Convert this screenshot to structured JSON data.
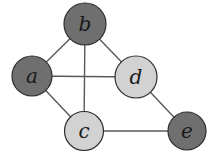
{
  "diagram": {
    "type": "graph",
    "colors": {
      "dark": "#6f6f6f",
      "light": "#d2d2d2",
      "edge": "#5a5a5a"
    },
    "nodes": [
      {
        "id": "a",
        "label": "a",
        "x": 32,
        "y": 76,
        "r": 20,
        "shade": "dark"
      },
      {
        "id": "b",
        "label": "b",
        "x": 85,
        "y": 24,
        "r": 21,
        "shade": "dark"
      },
      {
        "id": "c",
        "label": "c",
        "x": 84,
        "y": 131,
        "r": 19.5,
        "shade": "light"
      },
      {
        "id": "d",
        "label": "d",
        "x": 136,
        "y": 77,
        "r": 21,
        "shade": "light"
      },
      {
        "id": "e",
        "label": "e",
        "x": 187,
        "y": 131,
        "r": 19,
        "shade": "dark"
      }
    ],
    "edges": [
      [
        "a",
        "b"
      ],
      [
        "b",
        "d"
      ],
      [
        "a",
        "d"
      ],
      [
        "b",
        "c"
      ],
      [
        "a",
        "c"
      ],
      [
        "d",
        "e"
      ],
      [
        "c",
        "e"
      ]
    ]
  }
}
